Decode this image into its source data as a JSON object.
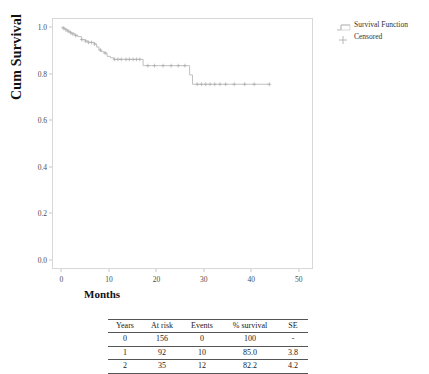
{
  "chart_data": {
    "type": "line",
    "subtype": "kaplan-meier-step",
    "title": "",
    "xlabel": "Months",
    "ylabel": "Cum Survival",
    "xlim": [
      -2,
      53
    ],
    "ylim": [
      -0.04,
      1.04
    ],
    "xticks": [
      "0",
      "10",
      "20",
      "30",
      "40",
      "50"
    ],
    "xtick_values": [
      0,
      10,
      20,
      30,
      40,
      50
    ],
    "yticks": [
      "0.0",
      "0.2",
      "0.4",
      "0.6",
      "0.8",
      "1.0"
    ],
    "ytick_values": [
      0.0,
      0.2,
      0.4,
      0.6,
      0.8,
      1.0
    ],
    "grid": false,
    "legend_position": "outside-right-top",
    "series": [
      {
        "name": "Survival Function",
        "type": "step",
        "color": "#b9b9b9",
        "points": [
          [
            0.0,
            1.0
          ],
          [
            0.6,
            0.993
          ],
          [
            1.1,
            0.987
          ],
          [
            1.6,
            0.98
          ],
          [
            2.1,
            0.974
          ],
          [
            2.8,
            0.967
          ],
          [
            3.4,
            0.96
          ],
          [
            4.2,
            0.947
          ],
          [
            5.0,
            0.941
          ],
          [
            5.6,
            0.935
          ],
          [
            6.2,
            0.935
          ],
          [
            6.9,
            0.928
          ],
          [
            7.4,
            0.915
          ],
          [
            7.9,
            0.902
          ],
          [
            8.4,
            0.895
          ],
          [
            9.0,
            0.889
          ],
          [
            9.6,
            0.875
          ],
          [
            10.3,
            0.869
          ],
          [
            11.0,
            0.862
          ],
          [
            12.0,
            0.862
          ],
          [
            13.0,
            0.862
          ],
          [
            14.0,
            0.862
          ],
          [
            15.0,
            0.862
          ],
          [
            16.0,
            0.862
          ],
          [
            16.8,
            0.862
          ],
          [
            17.2,
            0.835
          ],
          [
            19.0,
            0.835
          ],
          [
            21.0,
            0.835
          ],
          [
            23.0,
            0.835
          ],
          [
            25.0,
            0.835
          ],
          [
            26.6,
            0.835
          ],
          [
            27.0,
            0.795
          ],
          [
            27.6,
            0.755
          ],
          [
            30.0,
            0.755
          ],
          [
            33.0,
            0.755
          ],
          [
            36.5,
            0.755
          ],
          [
            40.0,
            0.755
          ],
          [
            44.0,
            0.755
          ]
        ]
      },
      {
        "name": "Censored",
        "type": "marker",
        "marker": "plus",
        "color": "#b0b0b0",
        "points": [
          [
            0.4,
            0.996
          ],
          [
            0.9,
            0.99
          ],
          [
            1.4,
            0.983
          ],
          [
            1.9,
            0.977
          ],
          [
            2.4,
            0.971
          ],
          [
            3.0,
            0.964
          ],
          [
            4.3,
            0.947
          ],
          [
            5.1,
            0.941
          ],
          [
            5.7,
            0.935
          ],
          [
            6.3,
            0.935
          ],
          [
            7.0,
            0.928
          ],
          [
            8.2,
            0.902
          ],
          [
            9.2,
            0.889
          ],
          [
            11.2,
            0.862
          ],
          [
            11.9,
            0.862
          ],
          [
            12.6,
            0.862
          ],
          [
            13.6,
            0.862
          ],
          [
            14.3,
            0.862
          ],
          [
            15.1,
            0.862
          ],
          [
            15.8,
            0.862
          ],
          [
            16.5,
            0.862
          ],
          [
            18.2,
            0.835
          ],
          [
            19.6,
            0.835
          ],
          [
            21.4,
            0.835
          ],
          [
            23.1,
            0.835
          ],
          [
            24.6,
            0.835
          ],
          [
            26.0,
            0.835
          ],
          [
            28.6,
            0.755
          ],
          [
            29.5,
            0.755
          ],
          [
            30.4,
            0.755
          ],
          [
            31.3,
            0.755
          ],
          [
            32.3,
            0.755
          ],
          [
            33.4,
            0.755
          ],
          [
            34.6,
            0.755
          ],
          [
            36.4,
            0.755
          ],
          [
            38.6,
            0.755
          ],
          [
            40.6,
            0.755
          ],
          [
            43.8,
            0.755
          ]
        ]
      }
    ]
  },
  "legend": {
    "items": [
      {
        "label": "Survival Function",
        "symbol": "step-line"
      },
      {
        "label": "Censored",
        "symbol": "plus"
      }
    ]
  },
  "axis": {
    "x_title": "Months",
    "y_title": "Cum Survival"
  },
  "risk_table": {
    "columns": [
      "Years",
      "At risk",
      "Events",
      "% survival",
      "SE"
    ],
    "rows": [
      {
        "years": "0",
        "at_risk": "156",
        "events": "0",
        "survival": "100",
        "se": "-"
      },
      {
        "years": "1",
        "at_risk": "92",
        "events": "10",
        "survival": "85.0",
        "se": "3.8"
      },
      {
        "years": "2",
        "at_risk": "35",
        "events": "12",
        "survival": "82.2",
        "se": "4.2"
      }
    ]
  },
  "colors": {
    "curve": "#b9b9b9",
    "frame": "#d8d8d8",
    "text": "#1a1a1a",
    "tick_text": "#4a4a4a",
    "rule": "#555555"
  }
}
